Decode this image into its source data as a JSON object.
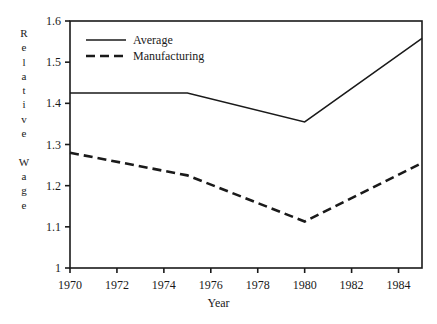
{
  "chart_data": {
    "type": "line",
    "title": "",
    "xlabel": "Year",
    "ylabel": "Relative Wage",
    "ylabel_stacked": [
      "R",
      "e",
      "l",
      "a",
      "t",
      "i",
      "v",
      "e",
      "",
      "W",
      "a",
      "g",
      "e"
    ],
    "x": [
      1970,
      1975,
      1980,
      1985
    ],
    "xlim": [
      1970,
      1985
    ],
    "ylim": [
      1.0,
      1.6
    ],
    "xticks": [
      1970,
      1972,
      1974,
      1976,
      1978,
      1980,
      1982,
      1984
    ],
    "xtick_labels": [
      "1970",
      "1972",
      "1974",
      "1976",
      "1978",
      "1980",
      "1982",
      "1984"
    ],
    "yticks": [
      1.0,
      1.1,
      1.2,
      1.3,
      1.4,
      1.5,
      1.6
    ],
    "ytick_labels": [
      "1",
      "1.1",
      "1.2",
      "1.3",
      "1.4",
      "1.5",
      "1.6"
    ],
    "grid": false,
    "legend_position": "upper-left-inside",
    "series": [
      {
        "name": "Average",
        "style": "solid",
        "color": "#1a1a1a",
        "values": [
          1.425,
          1.425,
          1.355,
          1.558
        ]
      },
      {
        "name": "Manufacturing",
        "style": "dashed",
        "color": "#1a1a1a",
        "values": [
          1.28,
          1.225,
          1.113,
          1.255
        ]
      }
    ]
  },
  "legend": {
    "items": [
      {
        "label": "Average",
        "style": "solid"
      },
      {
        "label": "Manufacturing",
        "style": "dashed"
      }
    ]
  },
  "axes": {
    "x_title": "Year",
    "y_title": "Relative Wage"
  },
  "colors": {
    "line": "#1a1a1a",
    "axis": "#1a1a1a",
    "background": "#ffffff"
  }
}
